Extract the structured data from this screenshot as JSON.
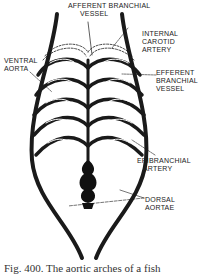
{
  "figure": {
    "labels": {
      "afferent_line1": "AFFERENT BRANCHIAL",
      "afferent_line2": "VESSEL",
      "internal_carotid_1": "INTERNAL",
      "internal_carotid_2": "CAROTID",
      "internal_carotid_3": "ARTERY",
      "ventral_1": "VENTRAL",
      "ventral_2": "AORTA",
      "efferent_1": "EFFERENT",
      "efferent_2": "BRANCHIAL",
      "efferent_3": "VESSEL",
      "epibranchial_1": "EPIBRANCHIAL",
      "epibranchial_2": "ARTERY",
      "dorsal_1": "DORSAL",
      "dorsal_2": "AORTAE"
    },
    "caption": "Fig. 400. The aortic arches of a fish"
  }
}
